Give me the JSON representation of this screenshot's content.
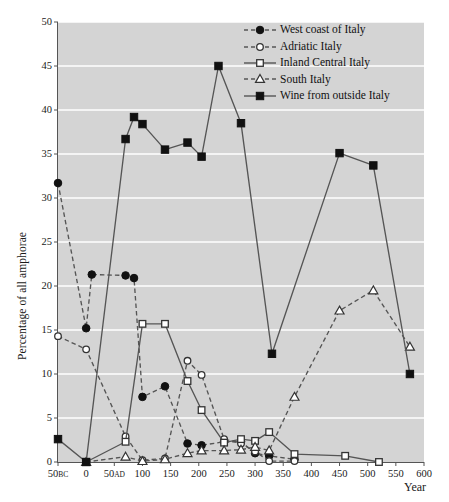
{
  "chart_data": {
    "type": "line",
    "title": "",
    "xlabel": "Year",
    "ylabel": "Percentage of all amphorae",
    "xlim": [
      -50,
      600
    ],
    "ylim": [
      0,
      50
    ],
    "grid": "horizontal-white",
    "legend_position": "top-right",
    "y_ticks": [
      0,
      5,
      10,
      15,
      20,
      25,
      30,
      35,
      40,
      45,
      50
    ],
    "x_ticks": [
      -50,
      0,
      50,
      100,
      150,
      200,
      250,
      300,
      350,
      400,
      450,
      500,
      550,
      600
    ],
    "x_tick_labels": [
      "50 BC",
      "0",
      "50 AD",
      "100",
      "150",
      "200",
      "250",
      "300",
      "350",
      "400",
      "450",
      "500",
      "550",
      "600"
    ],
    "series": [
      {
        "name": "West coast of Italy",
        "marker": "filled-circle",
        "line": "dashed",
        "x": [
          -50,
          0,
          10,
          70,
          85,
          100,
          140,
          180,
          205,
          245,
          275,
          300,
          325,
          370
        ],
        "values": [
          31.7,
          15.2,
          21.3,
          21.2,
          20.9,
          7.4,
          8.6,
          2.1,
          1.9,
          2.3,
          2.3,
          1.0,
          0.7,
          0.3
        ]
      },
      {
        "name": "Adriatic Italy",
        "marker": "open-circle",
        "line": "dashed",
        "x": [
          -50,
          0,
          70,
          100,
          140,
          180,
          205,
          245,
          275,
          300,
          325,
          370
        ],
        "values": [
          14.3,
          12.8,
          2.9,
          0.2,
          0.4,
          11.5,
          9.9,
          2.6,
          2.1,
          1.2,
          0.1,
          0.1
        ]
      },
      {
        "name": "Inland Central Italy",
        "marker": "open-square",
        "line": "solid",
        "x": [
          0,
          70,
          100,
          140,
          180,
          205,
          245,
          275,
          300,
          325,
          370,
          460,
          520
        ],
        "values": [
          0.0,
          2.3,
          15.7,
          15.7,
          9.2,
          5.9,
          2.2,
          2.6,
          2.4,
          3.4,
          0.9,
          0.7,
          0.0
        ]
      },
      {
        "name": "South Italy",
        "marker": "open-triangle",
        "line": "dashed",
        "x": [
          0,
          70,
          100,
          140,
          180,
          205,
          245,
          275,
          300,
          325,
          370,
          450,
          510,
          575
        ],
        "values": [
          0.0,
          0.6,
          0.1,
          0.3,
          1.0,
          1.3,
          1.3,
          1.4,
          1.7,
          1.3,
          7.4,
          17.2,
          19.5,
          13.1
        ]
      },
      {
        "name": "Wine from outside Italy",
        "marker": "filled-square",
        "line": "solid",
        "x": [
          -50,
          0,
          70,
          85,
          100,
          140,
          180,
          205,
          235,
          275,
          330,
          450,
          510,
          575
        ],
        "values": [
          2.6,
          0.0,
          36.7,
          39.2,
          38.4,
          35.5,
          36.3,
          34.7,
          45.0,
          38.5,
          12.3,
          35.1,
          33.7,
          10.0
        ]
      }
    ]
  },
  "legend": {
    "items": [
      {
        "label": "West coast of Italy"
      },
      {
        "label": "Adriatic Italy"
      },
      {
        "label": "Inland Central Italy"
      },
      {
        "label": "South Italy"
      },
      {
        "label": "Wine from outside Italy"
      }
    ]
  },
  "axes": {
    "y_title": "Percentage of all amphorae",
    "x_title": "Year"
  },
  "colors": {
    "plot_background": "#d4d4d4",
    "gridline": "#ffffff",
    "line": "#555555",
    "marker_fill_dark": "#111111",
    "marker_fill_light": "#ffffff",
    "axis": "#555555",
    "text": "#1a1a1a"
  }
}
